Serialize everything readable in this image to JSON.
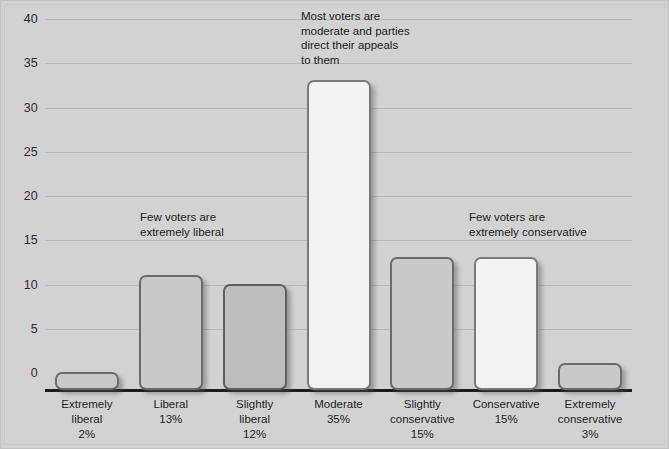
{
  "figure": {
    "background_color": "#d2d2d2",
    "border_color": "#c9c9c9"
  },
  "chart_data": {
    "type": "bar",
    "title": "",
    "subtitle": "",
    "xlabel": "",
    "ylabel": "",
    "ylim": [
      0,
      42
    ],
    "yticks": [
      0,
      5,
      10,
      15,
      20,
      25,
      30,
      35,
      40
    ],
    "grid": true,
    "legend": "none",
    "categories": [
      "Extremely liberal",
      "Liberal",
      "Slightly liberal",
      "Moderate",
      "Slightly conservative",
      "Conservative",
      "Extremely conservative"
    ],
    "values": [
      2,
      13,
      12,
      35,
      15,
      15,
      3
    ],
    "value_labels": [
      "2%",
      "13%",
      "12%",
      "35%",
      "15%",
      "15%",
      "3%"
    ],
    "bar_shades": [
      "mid",
      "mid",
      "dark",
      "light",
      "mid",
      "light",
      "mid"
    ],
    "annotations": [
      {
        "id": "moderate",
        "text": "Most voters are\nmoderate and parties\ndirect their appeals\nto them"
      },
      {
        "id": "liberal",
        "text": "Few voters are\nextremely liberal"
      },
      {
        "id": "conservative",
        "text": "Few voters are\nextremely conservative"
      }
    ]
  },
  "axis": {
    "tick_0": "0",
    "tick_5": "5",
    "tick_10": "10",
    "tick_15": "15",
    "tick_20": "20",
    "tick_25": "25",
    "tick_30": "30",
    "tick_35": "35",
    "tick_40": "40"
  },
  "xlabels": [
    "Extremely\nliberal\n2%",
    "Liberal\n13%",
    "Slightly\nliberal\n12%",
    "Moderate\n35%",
    "Slightly\nconservative\n15%",
    "Conservative\n15%",
    "Extremely\nconservative\n3%"
  ]
}
